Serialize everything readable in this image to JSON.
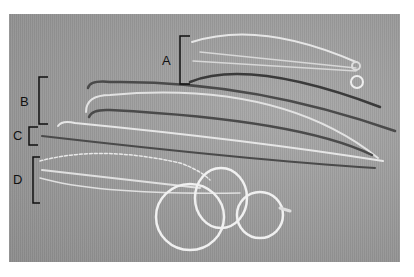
{
  "figure": {
    "labels": [
      {
        "id": "A",
        "text": "A"
      },
      {
        "id": "B",
        "text": "B"
      },
      {
        "id": "C",
        "text": "C"
      },
      {
        "id": "D",
        "text": "D"
      }
    ],
    "colors": {
      "drape": "#9a9a9a",
      "dark_instrument": "#3a3a3a",
      "light_instrument": "#e8e8e8",
      "bracket": "#111111"
    }
  }
}
